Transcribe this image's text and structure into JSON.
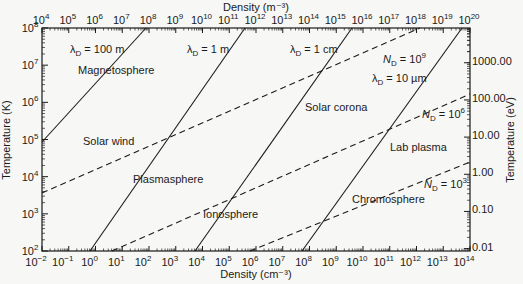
{
  "chart_data": {
    "type": "line",
    "title": "",
    "xlabel_bottom": "Density (cm⁻³)",
    "xlabel_top": "Density (m⁻³)",
    "ylabel_left": "Temperature (K)",
    "ylabel_right": "Temperature (eV)",
    "xscale": "log",
    "yscale": "log",
    "xlim_bottom": [
      0.01,
      100000000000000.0
    ],
    "xlim_top": [
      10000.0,
      1e+20
    ],
    "ylim_left": [
      100,
      100000000.0
    ],
    "bottom_ticks": [
      {
        "base": "10",
        "exp": "−2"
      },
      {
        "base": "10",
        "exp": "−1"
      },
      {
        "base": "10",
        "exp": "0"
      },
      {
        "base": "10",
        "exp": "1"
      },
      {
        "base": "10",
        "exp": "2"
      },
      {
        "base": "10",
        "exp": "3"
      },
      {
        "base": "10",
        "exp": "4"
      },
      {
        "base": "10",
        "exp": "5"
      },
      {
        "base": "10",
        "exp": "6"
      },
      {
        "base": "10",
        "exp": "7"
      },
      {
        "base": "10",
        "exp": "8"
      },
      {
        "base": "10",
        "exp": "9"
      },
      {
        "base": "10",
        "exp": "10"
      },
      {
        "base": "10",
        "exp": "11"
      },
      {
        "base": "10",
        "exp": "12"
      },
      {
        "base": "10",
        "exp": "13"
      },
      {
        "base": "10",
        "exp": "14"
      }
    ],
    "top_ticks": [
      {
        "base": "10",
        "exp": "4"
      },
      {
        "base": "10",
        "exp": "5"
      },
      {
        "base": "10",
        "exp": "6"
      },
      {
        "base": "10",
        "exp": "7"
      },
      {
        "base": "10",
        "exp": "8"
      },
      {
        "base": "10",
        "exp": "9"
      },
      {
        "base": "10",
        "exp": "10"
      },
      {
        "base": "10",
        "exp": "11"
      },
      {
        "base": "10",
        "exp": "12"
      },
      {
        "base": "10",
        "exp": "13"
      },
      {
        "base": "10",
        "exp": "14"
      },
      {
        "base": "10",
        "exp": "15"
      },
      {
        "base": "10",
        "exp": "16"
      },
      {
        "base": "10",
        "exp": "17"
      },
      {
        "base": "10",
        "exp": "18"
      },
      {
        "base": "10",
        "exp": "19"
      },
      {
        "base": "10",
        "exp": "20"
      }
    ],
    "left_ticks": [
      {
        "base": "10",
        "exp": "2"
      },
      {
        "base": "10",
        "exp": "3"
      },
      {
        "base": "10",
        "exp": "4"
      },
      {
        "base": "10",
        "exp": "5"
      },
      {
        "base": "10",
        "exp": "6"
      },
      {
        "base": "10",
        "exp": "7"
      },
      {
        "base": "10",
        "exp": "8"
      }
    ],
    "right_ticks": [
      "0.01",
      "0.10",
      "1.00",
      "10.00",
      "100.00",
      "1000.00"
    ],
    "series": [
      {
        "name": "λD = 100 m",
        "style": "solid",
        "points_px": [
          [
            42,
            142
          ],
          [
            146,
            28
          ]
        ]
      },
      {
        "name": "λD = 1 m",
        "style": "solid",
        "points_px": [
          [
            90,
            251
          ],
          [
            245,
            28
          ]
        ]
      },
      {
        "name": "λD = 1 cm",
        "style": "solid",
        "points_px": [
          [
            195,
            251
          ],
          [
            352,
            28
          ]
        ]
      },
      {
        "name": "λD = 10 µm",
        "style": "solid",
        "points_px": [
          [
            302,
            251
          ],
          [
            462,
            28
          ]
        ]
      },
      {
        "name": "ND = 10^9",
        "style": "dashed",
        "points_px": [
          [
            42,
            193
          ],
          [
            420,
            28
          ]
        ]
      },
      {
        "name": "ND = 10^6",
        "style": "dashed",
        "points_px": [
          [
            112,
            251
          ],
          [
            470,
            94
          ]
        ]
      },
      {
        "name": "ND = 10^3",
        "style": "dashed",
        "points_px": [
          [
            250,
            251
          ],
          [
            470,
            162
          ]
        ]
      }
    ],
    "line_labels": [
      {
        "text": "λ",
        "sub": "D",
        "rest": " = 100 m",
        "x": 70,
        "y": 53
      },
      {
        "text": "λ",
        "sub": "D",
        "rest": " = 1 m",
        "x": 187,
        "y": 53
      },
      {
        "text": "λ",
        "sub": "D",
        "rest": " = 1 cm",
        "x": 290,
        "y": 53
      },
      {
        "text": "N",
        "sub": "D",
        "rest": " = 10",
        "sup": "9",
        "x": 383,
        "y": 63
      },
      {
        "text": "λ",
        "sub": "D",
        "rest": " = 10 µm",
        "x": 372,
        "y": 82
      },
      {
        "text": "N",
        "sub": "D",
        "rest": " = 10",
        "sup": "6",
        "x": 422,
        "y": 118
      },
      {
        "text": "N",
        "sub": "D",
        "rest": " = 10",
        "sup": "3",
        "x": 424,
        "y": 188
      }
    ],
    "regions": [
      {
        "label": "Magnetosphere",
        "x": 78,
        "y": 74
      },
      {
        "label": "Solar wind",
        "x": 83,
        "y": 145
      },
      {
        "label": "Plasmasphere",
        "x": 133,
        "y": 183
      },
      {
        "label": "Ionosphere",
        "x": 203,
        "y": 218
      },
      {
        "label": "Solar corona",
        "x": 305,
        "y": 111
      },
      {
        "label": "Lab plasma",
        "x": 390,
        "y": 151
      },
      {
        "label": "Chromosphere",
        "x": 352,
        "y": 203
      }
    ],
    "grid": false,
    "legend": "none"
  }
}
